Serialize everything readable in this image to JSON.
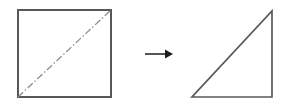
{
  "diagram": {
    "background_color": "#ffffff",
    "outline_color": "#575757",
    "fold_line_color": "#8d8d8d",
    "arrow_color": "#1c1c1c",
    "square": {
      "label": "square with diagonal fold line",
      "x": 18,
      "y": 10,
      "width": 93,
      "height": 87,
      "line_style": "solid",
      "stroke_width": 2
    },
    "fold_line": {
      "label": "diagonal fold line",
      "x1": 18,
      "y1": 97,
      "x2": 111,
      "y2": 10,
      "line_style": "dash-dot"
    },
    "arrow": {
      "label": "transformation arrow",
      "x1": 145,
      "y1": 54,
      "x2": 173,
      "y2": 54,
      "direction": "right"
    },
    "triangle": {
      "label": "right triangle result",
      "points": "192,97 272,97 272,11",
      "vertices": [
        {
          "name": "bottom-left",
          "x": 192,
          "y": 97
        },
        {
          "name": "bottom-right",
          "x": 272,
          "y": 97
        },
        {
          "name": "top-right",
          "x": 272,
          "y": 11
        }
      ],
      "line_style": "solid",
      "stroke_width": 1.7
    }
  }
}
